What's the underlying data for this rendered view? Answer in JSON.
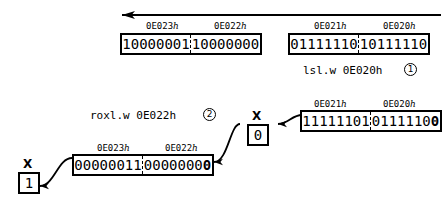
{
  "diagram": {
    "top_arrow": {
      "name": "carry-propagation-arrow",
      "direction": "left"
    },
    "words": [
      {
        "id": "word-0E023-0E022-before",
        "addr_hi": "0E023",
        "addr_lo": "0E022",
        "hex_suffix": "h",
        "bits_hi": "10000001",
        "bits_lo": "10000000",
        "bold_tail": ""
      },
      {
        "id": "word-0E021-0E020-before",
        "addr_hi": "0E021",
        "addr_lo": "0E020",
        "hex_suffix": "h",
        "bits_hi": "01111110",
        "bits_lo": "10111110",
        "bold_tail": ""
      },
      {
        "id": "word-0E021-0E020-after",
        "addr_hi": "0E021",
        "addr_lo": "0E020",
        "hex_suffix": "h",
        "bits_hi": "11111101",
        "bits_lo": "0111110",
        "bold_tail": "0"
      },
      {
        "id": "word-0E023-0E022-after",
        "addr_hi": "0E023",
        "addr_lo": "0E022",
        "hex_suffix": "h",
        "bits_hi": "00000011",
        "bits_lo": "0000000",
        "bold_tail": "0"
      }
    ],
    "flags": [
      {
        "id": "x-flag-middle",
        "label": "X",
        "value": "0"
      },
      {
        "id": "x-flag-left",
        "label": "X",
        "value": "1"
      }
    ],
    "instructions": [
      {
        "id": "instruction-lsl",
        "text": "lsl.w 0E020h",
        "marker": "1"
      },
      {
        "id": "instruction-roxl",
        "text": "roxl.w 0E022h",
        "marker": "2"
      }
    ]
  }
}
